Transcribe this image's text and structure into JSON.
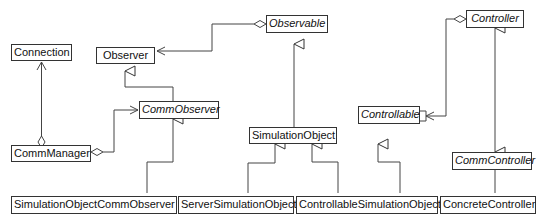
{
  "diagram": {
    "type": "UML class diagram",
    "classes": {
      "connection": {
        "name": "Connection",
        "abstract": false
      },
      "observer": {
        "name": "Observer",
        "abstract": false
      },
      "observable": {
        "name": "Observable",
        "abstract": true
      },
      "controller": {
        "name": "Controller",
        "abstract": true
      },
      "comm_manager": {
        "name": "CommManager",
        "abstract": false
      },
      "comm_observer": {
        "name": "CommObserver",
        "abstract": true
      },
      "simulation_object": {
        "name": "SimulationObject",
        "abstract": false
      },
      "controllable": {
        "name": "Controllable",
        "abstract": true
      },
      "comm_controller": {
        "name": "CommController",
        "abstract": true
      },
      "simulation_object_comm_observer": {
        "name": "SimulationObjectCommObserver",
        "abstract": false
      },
      "server_simulation_object": {
        "name": "ServerSimulationObject",
        "abstract": false
      },
      "controllable_simulation_object": {
        "name": "ControllableSimulationObject",
        "abstract": false
      },
      "concrete_controller": {
        "name": "ConcreteController",
        "abstract": false
      }
    },
    "relationships": [
      {
        "type": "aggregation-navigable",
        "from": "CommManager",
        "to": "Connection"
      },
      {
        "type": "aggregation-navigable",
        "from": "CommManager",
        "to": "CommObserver"
      },
      {
        "type": "aggregation-navigable",
        "from": "Observable",
        "to": "Observer"
      },
      {
        "type": "aggregation-navigable",
        "from": "Controller",
        "to": "Controllable"
      },
      {
        "type": "generalization",
        "from": "CommObserver",
        "to": "Observer"
      },
      {
        "type": "generalization",
        "from": "SimulationObject",
        "to": "Observable"
      },
      {
        "type": "generalization",
        "from": "SimulationObjectCommObserver",
        "to": "CommObserver"
      },
      {
        "type": "generalization",
        "from": "ServerSimulationObject",
        "to": "SimulationObject"
      },
      {
        "type": "generalization",
        "from": "ControllableSimulationObject",
        "to": "SimulationObject"
      },
      {
        "type": "generalization",
        "from": "ControllableSimulationObject",
        "to": "Controllable"
      },
      {
        "type": "generalization",
        "from": "CommController",
        "to": "Controller"
      },
      {
        "type": "generalization",
        "from": "ConcreteController",
        "to": "CommController"
      }
    ]
  }
}
